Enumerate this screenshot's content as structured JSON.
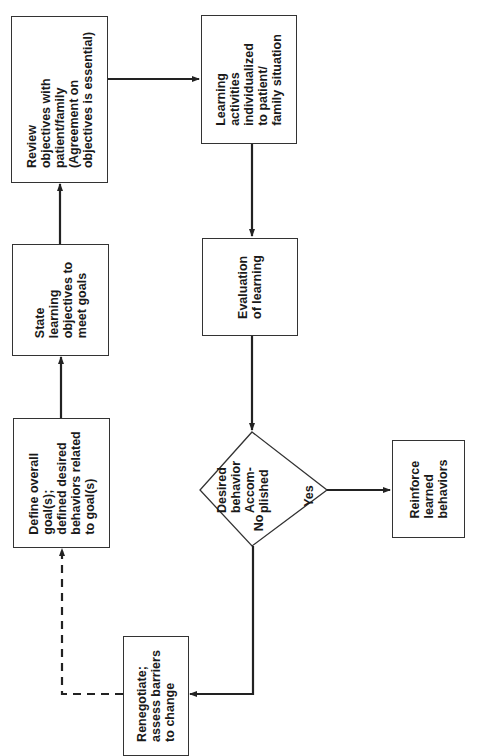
{
  "diagram": {
    "type": "flowchart",
    "orientation": "rotated-90-ccw",
    "nodes": [
      {
        "id": "define",
        "shape": "rect",
        "text": "Define overall\ngoal(s);\ndefined desired\nbehaviors related\nto goal(s)"
      },
      {
        "id": "state",
        "shape": "rect",
        "text": "State\nlearning\nobjectives to\nmeet goals"
      },
      {
        "id": "review",
        "shape": "rect",
        "text": "Review\nobjectives with\npatient/family\n(Agreement on\nobjectives is essential)"
      },
      {
        "id": "learning",
        "shape": "rect",
        "text": "Learning\nactivities\nindividualized\nto patient/\nfamily situation"
      },
      {
        "id": "evaluation",
        "shape": "rect",
        "text": "Evaluation\nof learning"
      },
      {
        "id": "decision",
        "shape": "diamond",
        "text": "Desired\nbehavior\nAccom-\nplished"
      },
      {
        "id": "reinforce",
        "shape": "rect",
        "text": "Reinforce\nlearned\nbehaviors"
      },
      {
        "id": "renegotiate",
        "shape": "rect",
        "text": "Renegotiate;\nassess barriers\nto change"
      }
    ],
    "edges": [
      {
        "from": "define",
        "to": "state",
        "style": "solid"
      },
      {
        "from": "state",
        "to": "review",
        "style": "solid"
      },
      {
        "from": "review",
        "to": "learning",
        "style": "solid"
      },
      {
        "from": "learning",
        "to": "evaluation",
        "style": "solid"
      },
      {
        "from": "evaluation",
        "to": "decision",
        "style": "solid"
      },
      {
        "from": "decision",
        "to": "reinforce",
        "style": "solid",
        "label": "Yes"
      },
      {
        "from": "decision",
        "to": "renegotiate",
        "style": "solid",
        "label": "No"
      },
      {
        "from": "renegotiate",
        "to": "define",
        "style": "dashed"
      }
    ],
    "labels": {
      "yes": "Yes",
      "no": "No"
    },
    "colors": {
      "stroke": "#222222",
      "background": "#ffffff"
    }
  }
}
